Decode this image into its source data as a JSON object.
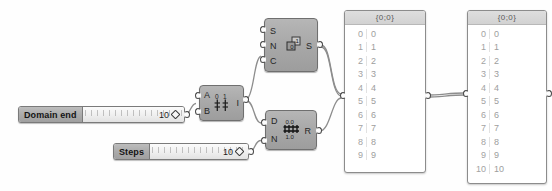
{
  "canvas": {
    "title": "Grasshopper definition canvas",
    "background": "#fefefe",
    "node_color": "#a9a9a9",
    "wire_color": "#8a8a8a"
  },
  "sliders": [
    {
      "name": "Domain end",
      "value": "10",
      "handle_icon": "diamond-handle-icon"
    },
    {
      "name": "Steps",
      "value": "10",
      "handle_icon": "diamond-handle-icon"
    }
  ],
  "nodes": [
    {
      "id": "series",
      "inputs": [
        "S",
        "N",
        "C"
      ],
      "outputs": [
        "S"
      ],
      "glyph": "series-icon"
    },
    {
      "id": "interval",
      "inputs": [
        "A",
        "B"
      ],
      "outputs": [
        "I"
      ],
      "glyph": "interval-icon"
    },
    {
      "id": "range",
      "inputs": [
        "D",
        "N"
      ],
      "outputs": [
        "R"
      ],
      "glyph": "range-icon",
      "glyph_top": "0.0",
      "glyph_bottom": "1.0"
    }
  ],
  "panels": [
    {
      "id": "panel-series",
      "header": "{0;0}",
      "rows": [
        {
          "index": "0",
          "value": "0"
        },
        {
          "index": "1",
          "value": "1"
        },
        {
          "index": "2",
          "value": "2"
        },
        {
          "index": "3",
          "value": "3"
        },
        {
          "index": "4",
          "value": "4"
        },
        {
          "index": "5",
          "value": "5"
        },
        {
          "index": "6",
          "value": "6"
        },
        {
          "index": "7",
          "value": "7"
        },
        {
          "index": "8",
          "value": "8"
        },
        {
          "index": "9",
          "value": "9"
        }
      ]
    },
    {
      "id": "panel-range",
      "header": "{0;0}",
      "rows": [
        {
          "index": "0",
          "value": "0"
        },
        {
          "index": "1",
          "value": "1"
        },
        {
          "index": "2",
          "value": "2"
        },
        {
          "index": "3",
          "value": "3"
        },
        {
          "index": "4",
          "value": "4"
        },
        {
          "index": "5",
          "value": "5"
        },
        {
          "index": "6",
          "value": "6"
        },
        {
          "index": "7",
          "value": "7"
        },
        {
          "index": "8",
          "value": "8"
        },
        {
          "index": "9",
          "value": "9"
        },
        {
          "index": "10",
          "value": "10"
        }
      ]
    }
  ]
}
